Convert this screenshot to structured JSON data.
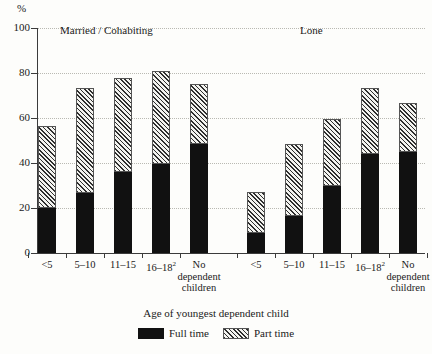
{
  "chart_data": {
    "type": "bar",
    "stacked": true,
    "title": "",
    "xlabel": "Age of youngest dependent child",
    "ylabel": "%",
    "ylim": [
      0,
      100
    ],
    "yticks": [
      0,
      20,
      40,
      60,
      80,
      100
    ],
    "grid": "horizontal-dotted",
    "legend_position": "bottom-center",
    "legend": [
      "Full time",
      "Part time"
    ],
    "group_labels": [
      "Married / Cohabiting",
      "Lone"
    ],
    "categories": [
      "<5",
      "5–10",
      "11–15",
      "16–18²",
      "No dependent children"
    ],
    "groups": [
      {
        "name": "Married / Cohabiting",
        "series": [
          {
            "name": "Full time",
            "values": [
              20.0,
              26.5,
              36.0,
              39.5,
              48.5
            ]
          },
          {
            "name": "Part time",
            "values": [
              36.5,
              47.0,
              42.0,
              41.5,
              26.5
            ]
          }
        ],
        "totals": [
          56.5,
          73.5,
          78.0,
          81.0,
          75.0
        ]
      },
      {
        "name": "Lone",
        "series": [
          {
            "name": "Full time",
            "values": [
              9.0,
              16.5,
              30.0,
              44.0,
              45.0
            ]
          },
          {
            "name": "Part time",
            "values": [
              18.0,
              32.0,
              29.5,
              29.5,
              21.5
            ]
          }
        ],
        "totals": [
          27.0,
          48.5,
          59.5,
          73.5,
          66.5
        ]
      }
    ]
  },
  "axis": {
    "percent_sign": "%",
    "y_tick_labels": [
      "100",
      "80",
      "60",
      "40",
      "20",
      "0"
    ],
    "x_caption": "Age of youngest dependent child"
  },
  "x_labels": [
    {
      "line1": "<5",
      "sup": "",
      "line2": "",
      "line3": ""
    },
    {
      "line1": "5–10",
      "sup": "",
      "line2": "",
      "line3": ""
    },
    {
      "line1": "11–15",
      "sup": "",
      "line2": "",
      "line3": ""
    },
    {
      "line1": "16–18",
      "sup": "2",
      "line2": "",
      "line3": ""
    },
    {
      "line1": "No",
      "sup": "",
      "line2": "dependent",
      "line3": "children"
    },
    {
      "line1": "<5",
      "sup": "",
      "line2": "",
      "line3": ""
    },
    {
      "line1": "5–10",
      "sup": "",
      "line2": "",
      "line3": ""
    },
    {
      "line1": "11–15",
      "sup": "",
      "line2": "",
      "line3": ""
    },
    {
      "line1": "16–18",
      "sup": "2",
      "line2": "",
      "line3": ""
    },
    {
      "line1": "No",
      "sup": "",
      "line2": "dependent",
      "line3": "children"
    }
  ],
  "group_titles": {
    "married": "Married / Cohabiting",
    "lone": "Lone"
  },
  "legend": {
    "full_time": "Full time",
    "part_time": "Part time"
  },
  "colors": {
    "full_time": "#111111",
    "part_time_hatch": "#2e2e2e",
    "part_time_fill": "#f3f3ef",
    "axis": "#3b3b3b",
    "gridline": "#b9b9b2",
    "background": "#fdfdfb"
  }
}
